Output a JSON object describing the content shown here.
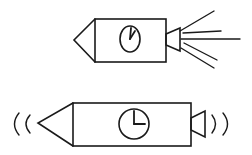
{
  "diagram": {
    "type": "line-drawing",
    "ink_color": "#1a1a1a",
    "background": "#ffffff",
    "figures": [
      {
        "id": "rocket-top",
        "description": "Rocket with clock, nozzle emitting exhaust lines",
        "nose": {
          "tip": [
            74,
            40
          ],
          "top": [
            95,
            19
          ],
          "bottom": [
            95,
            62
          ]
        },
        "body": {
          "x": 95,
          "y": 19,
          "w": 71,
          "h": 43
        },
        "clock": {
          "shape": "ellipse",
          "cx": 130,
          "cy": 39,
          "rx": 10,
          "ry": 13,
          "hour_hand": [
            134,
            30
          ],
          "minute_hand": [
            131,
            28
          ]
        },
        "nozzle": [
          [
            166,
            34
          ],
          [
            180,
            28
          ],
          [
            180,
            51
          ],
          [
            166,
            45
          ]
        ],
        "exhaust_lines": [
          [
            [
              180,
              31
            ],
            [
              214,
              11
            ]
          ],
          [
            [
              183,
              33
            ],
            [
              221,
              31
            ]
          ],
          [
            [
              181,
              39
            ],
            [
              240,
              39
            ]
          ],
          [
            [
              184,
              43
            ],
            [
              217,
              60
            ]
          ],
          [
            [
              181,
              48
            ],
            [
              214,
              68
            ]
          ]
        ]
      },
      {
        "id": "rocket-bottom",
        "description": "Rocket with clock, emitting sound waves at both ends",
        "nose": {
          "tip": [
            38,
            123
          ],
          "top": [
            73,
            103
          ],
          "bottom": [
            73,
            146
          ]
        },
        "body": {
          "x": 73,
          "y": 103,
          "w": 118,
          "h": 43
        },
        "clock": {
          "shape": "circle",
          "cx": 134,
          "cy": 124,
          "r": 15,
          "hour_hand": [
            134,
            111
          ],
          "minute_hand": [
            145,
            124
          ]
        },
        "nozzle": [
          [
            191,
            118
          ],
          [
            205,
            111
          ],
          [
            205,
            137
          ],
          [
            191,
            130
          ]
        ],
        "sound_waves": {
          "left": [
            {
              "x": 16,
              "y": 124,
              "h": 22
            },
            {
              "x": 28,
              "y": 124,
              "h": 18
            }
          ],
          "right": [
            {
              "x": 214,
              "y": 124,
              "h": 18
            },
            {
              "x": 226,
              "y": 124,
              "h": 22
            }
          ]
        }
      }
    ]
  }
}
